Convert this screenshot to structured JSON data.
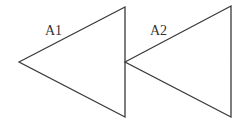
{
  "diagram": {
    "stroke_color": "#3a3a3a",
    "shapes": [
      {
        "id": "triangle-1",
        "label": "A1",
        "points": "19,62 125,7 125,117"
      },
      {
        "id": "triangle-2",
        "label": "A2",
        "points": "125,62 231,6 231,117"
      }
    ]
  }
}
